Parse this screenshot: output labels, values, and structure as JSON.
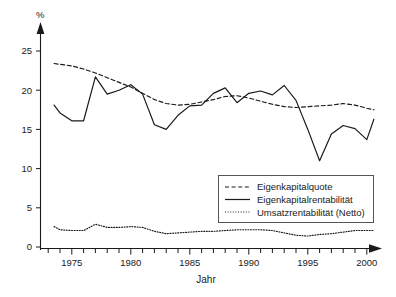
{
  "chart_data": {
    "type": "line",
    "title": "",
    "xlabel": "Jahr",
    "ylabel": "%",
    "xlim": [
      1973.5,
      2000.8
    ],
    "ylim": [
      0,
      26.5
    ],
    "xticks": [
      1975,
      1980,
      1985,
      1990,
      1995,
      2000
    ],
    "xtick_labels": [
      "1975",
      "1980",
      "1985",
      "1990",
      "1995",
      "2000"
    ],
    "yticks": [
      0,
      5,
      10,
      15,
      20,
      25
    ],
    "ytick_labels": [
      "0",
      "5",
      "10",
      "15",
      "20",
      "25"
    ],
    "minor_xticks_every": 1,
    "grid": false,
    "legend_position": "center-right",
    "x": [
      1973.5,
      1974,
      1975,
      1976,
      1977,
      1978,
      1979,
      1980,
      1981,
      1982,
      1983,
      1984,
      1985,
      1986,
      1987,
      1988,
      1989,
      1990,
      1991,
      1992,
      1993,
      1994,
      1995,
      1996,
      1997,
      1998,
      1999,
      2000,
      2000.6
    ],
    "series": [
      {
        "name": "Eigenkapitalquote",
        "style": "dashed",
        "color": "#1a1a1a",
        "values": [
          23.4,
          23.3,
          23.1,
          22.7,
          22.2,
          21.6,
          21.0,
          20.4,
          19.6,
          18.8,
          18.3,
          18.1,
          18.2,
          18.5,
          18.8,
          19.2,
          19.3,
          19.0,
          18.6,
          18.2,
          17.9,
          17.8,
          17.9,
          18.0,
          18.1,
          18.3,
          18.1,
          17.7,
          17.5
        ]
      },
      {
        "name": "Eigenkapitalrentabilität",
        "style": "solid",
        "color": "#1a1a1a",
        "values": [
          18.1,
          17.1,
          16.1,
          16.1,
          21.7,
          19.5,
          20.0,
          20.7,
          19.5,
          15.6,
          15.0,
          16.8,
          18.0,
          18.1,
          19.6,
          20.3,
          18.4,
          19.6,
          19.9,
          19.4,
          20.6,
          18.7,
          15.0,
          11.0,
          14.4,
          15.5,
          15.1,
          13.7,
          16.3
        ]
      },
      {
        "name": "Umsatzrentabilität (Netto)",
        "style": "dotted",
        "color": "#1a1a1a",
        "values": [
          2.6,
          2.2,
          2.1,
          2.1,
          2.9,
          2.5,
          2.5,
          2.6,
          2.5,
          2.0,
          1.7,
          1.8,
          1.9,
          2.0,
          2.0,
          2.1,
          2.2,
          2.2,
          2.2,
          2.1,
          1.8,
          1.5,
          1.4,
          1.6,
          1.7,
          1.9,
          2.1,
          2.1,
          2.1
        ]
      }
    ],
    "extra_series_tail": {
      "note": "solid line rises to 20.6 at 1998 peak then dips and ends near 18.8",
      "solid_tail_x": [
        1996.5,
        1998,
        1999,
        2000.6
      ],
      "solid_tail_y": [
        13.7,
        20.6,
        18.1,
        18.8
      ]
    }
  },
  "legend": {
    "items": [
      {
        "label": "Eigenkapitalquote",
        "style": "dashed"
      },
      {
        "label": "Eigenkapitalrentabilität",
        "style": "solid"
      },
      {
        "label": "Umsatzrentabilität (Netto)",
        "style": "dotted"
      }
    ]
  },
  "caption": {
    "text": ""
  }
}
